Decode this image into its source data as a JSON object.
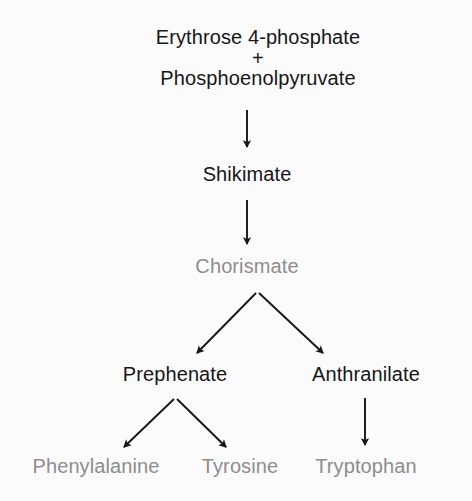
{
  "diagram": {
    "background_color": "#fbfbfb",
    "colors": {
      "primary_text": "#161616",
      "muted_text": "#8d8d8d",
      "arrow": "#161616"
    },
    "nodes": {
      "erythrose_4_phosphate": {
        "label": "Erythrose 4-phosphate",
        "color": "#161616",
        "state": "primary"
      },
      "plus": {
        "label": "+",
        "color": "#161616",
        "state": "primary"
      },
      "phosphoenolpyruvate": {
        "label": "Phosphoenolpyruvate",
        "color": "#161616",
        "state": "primary"
      },
      "shikimate": {
        "label": "Shikimate",
        "color": "#161616",
        "state": "primary"
      },
      "chorismate": {
        "label": "Chorismate",
        "color": "#8d8d8d",
        "state": "muted"
      },
      "prephenate": {
        "label": "Prephenate",
        "color": "#161616",
        "state": "primary"
      },
      "anthranilate": {
        "label": "Anthranilate",
        "color": "#161616",
        "state": "primary"
      },
      "phenylalanine": {
        "label": "Phenylalanine",
        "color": "#8d8d8d",
        "state": "muted"
      },
      "tyrosine": {
        "label": "Tyrosine",
        "color": "#8d8d8d",
        "state": "muted"
      },
      "tryptophan": {
        "label": "Tryptophan",
        "color": "#8d8d8d",
        "state": "muted"
      }
    },
    "edges": [
      {
        "name": "substrates-to-shikimate",
        "from": "phosphoenolpyruvate",
        "to": "shikimate",
        "kind": "straight-down"
      },
      {
        "name": "shikimate-to-chorismate",
        "from": "shikimate",
        "to": "chorismate",
        "kind": "straight-down"
      },
      {
        "name": "chorismate-to-prephenate",
        "from": "chorismate",
        "to": "prephenate",
        "kind": "branch-left"
      },
      {
        "name": "chorismate-to-anthranilate",
        "from": "chorismate",
        "to": "anthranilate",
        "kind": "branch-right"
      },
      {
        "name": "prephenate-to-phenylalanine",
        "from": "prephenate",
        "to": "phenylalanine",
        "kind": "branch-left"
      },
      {
        "name": "prephenate-to-tyrosine",
        "from": "prephenate",
        "to": "tyrosine",
        "kind": "branch-right"
      },
      {
        "name": "anthranilate-to-tryptophan",
        "from": "anthranilate",
        "to": "tryptophan",
        "kind": "straight-down"
      }
    ]
  }
}
